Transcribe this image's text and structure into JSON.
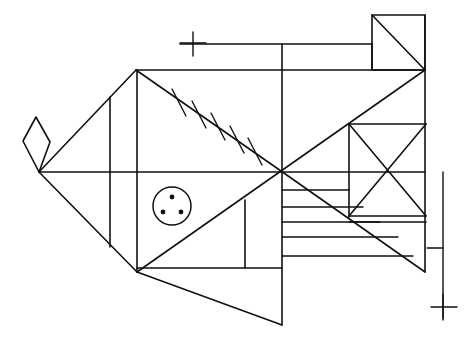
{
  "artwork": {
    "title": "Geometric Fish Line Drawing",
    "medium": "pen-and-ink line art",
    "background_color": "#ffffff",
    "stroke_color": "#111111",
    "stroke_width": 1.6,
    "canvas": {
      "width": 472,
      "height": 343
    }
  },
  "shapes": {
    "tail_diamond": {
      "name": "tail-fin-diamond",
      "points": "36,117 23,141 39,172 50,142"
    },
    "body_outline": {
      "name": "fish-body-outline",
      "points": "39,172 136,70 425,70 425,272 282,272"
    },
    "snout_lines": [
      {
        "name": "snout-upper-edge",
        "x1": 39,
        "y1": 172,
        "x2": 136,
        "y2": 70
      },
      {
        "name": "snout-lower-edge",
        "x1": 39,
        "y1": 172,
        "x2": 137,
        "y2": 272
      }
    ],
    "spine_axis": {
      "name": "horizontal-spine-line",
      "x1": 39,
      "y1": 172,
      "x2": 425,
      "y2": 172
    },
    "body_verticals": [
      {
        "name": "head-vertical-left",
        "x1": 110,
        "y1": 97,
        "x2": 110,
        "y2": 247
      },
      {
        "name": "head-vertical-right",
        "x1": 137,
        "y1": 70,
        "x2": 137,
        "y2": 272
      },
      {
        "name": "mid-vertical",
        "x1": 282,
        "y1": 44,
        "x2": 282,
        "y2": 325
      },
      {
        "name": "fin-box-vertical",
        "x1": 245,
        "y1": 200,
        "x2": 245,
        "y2": 268
      },
      {
        "name": "tail-square-left-vertical",
        "x1": 349,
        "y1": 124,
        "x2": 349,
        "y2": 217
      },
      {
        "name": "body-right-vertical",
        "x1": 425,
        "y1": 15,
        "x2": 425,
        "y2": 272
      }
    ],
    "body_horizontals": [
      {
        "name": "dorsal-top-line",
        "x1": 136,
        "y1": 70,
        "x2": 425,
        "y2": 70
      },
      {
        "name": "gill-box-bottom",
        "x1": 137,
        "y1": 268,
        "x2": 282,
        "y2": 268
      },
      {
        "name": "upper-rail-line",
        "x1": 180,
        "y1": 44,
        "x2": 372,
        "y2": 44
      },
      {
        "name": "tail-square-top",
        "x1": 349,
        "y1": 124,
        "x2": 426,
        "y2": 124
      },
      {
        "name": "tail-square-bottom",
        "x1": 349,
        "y1": 216,
        "x2": 426,
        "y2": 216
      },
      {
        "name": "tail-square-under-line",
        "x1": 349,
        "y1": 222,
        "x2": 426,
        "y2": 222
      }
    ],
    "diagonals": [
      {
        "name": "dorsal-hatch-diagonal",
        "x1": 136,
        "y1": 70,
        "x2": 281,
        "y2": 171
      },
      {
        "name": "center-x-upper-right",
        "x1": 281,
        "y1": 171,
        "x2": 425,
        "y2": 70
      },
      {
        "name": "center-x-lower-left",
        "x1": 281,
        "y1": 171,
        "x2": 137,
        "y2": 272
      },
      {
        "name": "center-x-lower-right",
        "x1": 281,
        "y1": 171,
        "x2": 425,
        "y2": 272
      },
      {
        "name": "tail-square-diag-down",
        "x1": 349,
        "y1": 124,
        "x2": 426,
        "y2": 216
      },
      {
        "name": "tail-square-diag-up",
        "x1": 349,
        "y1": 216,
        "x2": 426,
        "y2": 124
      },
      {
        "name": "top-fin-diagonal",
        "x1": 372,
        "y1": 15,
        "x2": 425,
        "y2": 70
      },
      {
        "name": "lower-fin-diagonal",
        "x1": 137,
        "y1": 272,
        "x2": 282,
        "y2": 325
      }
    ],
    "top_fin_rect": {
      "name": "top-dorsal-fin-rect",
      "points": "372,15 425,15 425,70 372,70"
    },
    "top_fin_inner": {
      "name": "top-fin-inner-step",
      "x1": 372,
      "y1": 44,
      "x2": 372,
      "y2": 70
    },
    "stripes": [
      {
        "name": "body-stripe-1",
        "x1": 282,
        "y1": 190,
        "x2": 349,
        "y2": 190
      },
      {
        "name": "body-stripe-2",
        "x1": 282,
        "y1": 207,
        "x2": 363,
        "y2": 207
      },
      {
        "name": "body-stripe-3",
        "x1": 282,
        "y1": 222,
        "x2": 380,
        "y2": 222
      },
      {
        "name": "body-stripe-4",
        "x1": 282,
        "y1": 237,
        "x2": 398,
        "y2": 237
      },
      {
        "name": "body-stripe-5",
        "x1": 282,
        "y1": 256,
        "x2": 413,
        "y2": 256
      }
    ],
    "hatch_marks": [
      {
        "name": "dorsal-hatch-1",
        "x1": 172,
        "y1": 89,
        "x2": 186,
        "y2": 116
      },
      {
        "name": "dorsal-hatch-2",
        "x1": 192,
        "y1": 101,
        "x2": 206,
        "y2": 128
      },
      {
        "name": "dorsal-hatch-3",
        "x1": 211,
        "y1": 113,
        "x2": 225,
        "y2": 140
      },
      {
        "name": "dorsal-hatch-4",
        "x1": 230,
        "y1": 126,
        "x2": 244,
        "y2": 153
      },
      {
        "name": "dorsal-hatch-5",
        "x1": 248,
        "y1": 138,
        "x2": 262,
        "y2": 165
      }
    ],
    "eye": {
      "name": "fish-eye",
      "cx": 172,
      "cy": 206,
      "r": 19,
      "pupils": [
        {
          "name": "eye-dot-top",
          "cx": 172,
          "cy": 197,
          "r": 2.4
        },
        {
          "name": "eye-dot-left",
          "cx": 163,
          "cy": 212,
          "r": 2.4
        },
        {
          "name": "eye-dot-right",
          "cx": 181,
          "cy": 212,
          "r": 2.4
        }
      ]
    },
    "registration_marks": {
      "top_cross": {
        "name": "top-registration-cross",
        "h": {
          "x1": 180,
          "y1": 43,
          "x2": 206,
          "y2": 43
        },
        "v": {
          "x1": 193,
          "y1": 32,
          "x2": 193,
          "y2": 56
        }
      },
      "right_rule": {
        "name": "right-vertical-rule",
        "v": {
          "x1": 443,
          "y1": 172,
          "x2": 443,
          "y2": 318
        },
        "tick": {
          "x1": 427,
          "y1": 248,
          "x2": 443,
          "y2": 248
        }
      },
      "bottom_cross": {
        "name": "bottom-registration-cross",
        "h": {
          "x1": 431,
          "y1": 307,
          "x2": 457,
          "y2": 307
        },
        "v": {
          "x1": 443,
          "y1": 294,
          "x2": 443,
          "y2": 320
        }
      }
    }
  }
}
